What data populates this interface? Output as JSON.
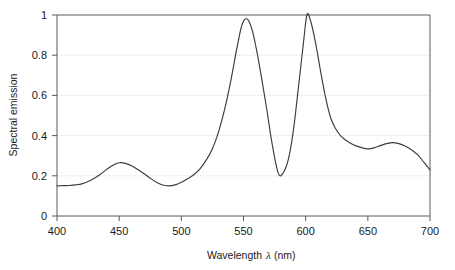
{
  "chart_data": {
    "type": "line",
    "title": "",
    "xlabel": "Wavelength λ (nm)",
    "xlabel_parts": {
      "pre": "Wavelength",
      "symbol": "λ",
      "post": "(nm)"
    },
    "ylabel": "Spectral emission",
    "xlim": [
      400,
      700
    ],
    "ylim": [
      0,
      1
    ],
    "xticks": [
      400,
      450,
      500,
      550,
      600,
      650,
      700
    ],
    "xticklabels": [
      "400",
      "450",
      "500",
      "550",
      "600",
      "650",
      "700"
    ],
    "yticks": [
      0,
      0.2,
      0.4,
      0.6,
      0.8,
      1
    ],
    "yticklabels": [
      "0",
      "0.2",
      "0.4",
      "0.6",
      "0.8",
      "1"
    ],
    "grid": "horizontal-dotted",
    "gridlines_y": [
      0.2,
      0.4,
      0.6,
      0.8
    ],
    "legend": "none",
    "series": [
      {
        "name": "Spectral emission",
        "line_color": "#3c3c3c",
        "x": [
          400,
          405,
          410,
          415,
          420,
          425,
          430,
          435,
          440,
          445,
          450,
          455,
          460,
          465,
          470,
          475,
          480,
          485,
          490,
          495,
          500,
          505,
          510,
          515,
          520,
          525,
          530,
          535,
          540,
          545,
          549,
          553,
          557,
          561,
          565,
          569,
          573,
          578,
          582,
          586,
          590,
          594,
          598,
          601,
          604,
          608,
          612,
          616,
          620,
          624,
          628,
          632,
          636,
          640,
          645,
          650,
          655,
          660,
          665,
          670,
          675,
          680,
          685,
          690,
          695,
          700
        ],
        "y": [
          0.15,
          0.151,
          0.152,
          0.155,
          0.16,
          0.172,
          0.188,
          0.208,
          0.232,
          0.253,
          0.265,
          0.262,
          0.25,
          0.231,
          0.21,
          0.188,
          0.168,
          0.154,
          0.15,
          0.155,
          0.168,
          0.185,
          0.205,
          0.235,
          0.278,
          0.335,
          0.42,
          0.535,
          0.68,
          0.845,
          0.955,
          0.98,
          0.925,
          0.81,
          0.67,
          0.52,
          0.36,
          0.212,
          0.215,
          0.28,
          0.42,
          0.63,
          0.85,
          1.0,
          0.97,
          0.86,
          0.72,
          0.59,
          0.49,
          0.435,
          0.4,
          0.378,
          0.362,
          0.35,
          0.34,
          0.334,
          0.339,
          0.35,
          0.36,
          0.365,
          0.36,
          0.348,
          0.33,
          0.305,
          0.268,
          0.23
        ],
        "annotations": [
          {
            "label": "peak-blue",
            "x": 450,
            "y": 0.265
          },
          {
            "label": "valley-cyan",
            "x": 487,
            "y": 0.15
          },
          {
            "label": "peak-green",
            "x": 551,
            "y": 0.98
          },
          {
            "label": "valley-yellow",
            "x": 578,
            "y": 0.212
          },
          {
            "label": "peak-orange",
            "x": 601,
            "y": 1.0
          },
          {
            "label": "valley-red",
            "x": 650,
            "y": 0.334
          },
          {
            "label": "shoulder-deep-red",
            "x": 670,
            "y": 0.365
          }
        ]
      }
    ]
  }
}
